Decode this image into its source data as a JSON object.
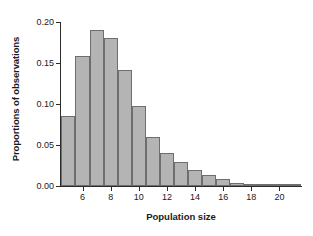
{
  "chart_data": {
    "type": "bar",
    "title": "",
    "subtitle": "",
    "xlabel": "Population size",
    "ylabel": "Proportions of observations",
    "categories": [
      5,
      6,
      7,
      8,
      9,
      10,
      11,
      12,
      13,
      14,
      15,
      16,
      17,
      18,
      19,
      20,
      21
    ],
    "values": [
      0.085,
      0.159,
      0.19,
      0.18,
      0.141,
      0.097,
      0.06,
      0.04,
      0.029,
      0.02,
      0.013,
      0.008,
      0.004,
      0.003,
      0.002,
      0.001,
      0.0005
    ],
    "series": [
      {
        "name": "Proportions of observations",
        "values": [
          0.085,
          0.159,
          0.19,
          0.18,
          0.141,
          0.097,
          0.06,
          0.04,
          0.029,
          0.02,
          0.013,
          0.008,
          0.004,
          0.003,
          0.002,
          0.001,
          0.0005
        ]
      }
    ],
    "xlim": [
      4.4,
      21.6
    ],
    "ylim": [
      0.0,
      0.2
    ],
    "yticks": [
      0.0,
      0.05,
      0.1,
      0.15,
      0.2
    ],
    "yticklabels": [
      "0.00",
      "0.05",
      "0.10",
      "0.15",
      "0.20"
    ],
    "xticks": [
      6,
      8,
      10,
      12,
      14,
      16,
      18,
      20
    ],
    "xticklabels": [
      "6",
      "8",
      "10",
      "12",
      "14",
      "16",
      "18",
      "20"
    ],
    "grid": false,
    "legend": null,
    "legend_position": "none",
    "bar_fill_color": "#b4b4b4",
    "bar_edge_color": "#6e6e6e",
    "axis_color": "#2b2b2b",
    "background_color": "#ffffff"
  }
}
